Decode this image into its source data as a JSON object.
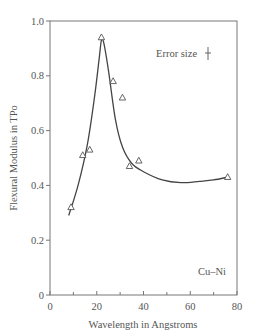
{
  "chart_data": {
    "type": "scatter",
    "title": "",
    "xlabel": "Wavelength in Angstroms",
    "ylabel": "Flexural Modulus in TPo",
    "xlim": [
      0,
      80
    ],
    "ylim": [
      0,
      1.0
    ],
    "x_ticks": [
      "0",
      "20",
      "40",
      "60",
      "80"
    ],
    "y_ticks": [
      "0",
      "0.2",
      "0.4",
      "0.6",
      "0.8",
      "1.0"
    ],
    "grid": false,
    "series": [
      {
        "name": "Cu-Ni data",
        "marker": "triangle-open",
        "x": [
          9,
          14,
          17,
          22,
          27,
          31,
          34,
          38,
          76
        ],
        "y": [
          0.32,
          0.51,
          0.53,
          0.94,
          0.78,
          0.72,
          0.47,
          0.49,
          0.43
        ]
      }
    ],
    "fit_curve": {
      "name": "fitted curve",
      "x": [
        8,
        12,
        16,
        19,
        21,
        22,
        23,
        25,
        28,
        31,
        35,
        40,
        48,
        56,
        64,
        70,
        76
      ],
      "y": [
        0.29,
        0.4,
        0.55,
        0.72,
        0.86,
        0.93,
        0.92,
        0.82,
        0.64,
        0.54,
        0.48,
        0.45,
        0.42,
        0.41,
        0.415,
        0.42,
        0.43
      ]
    },
    "annotations": [
      "Error size",
      "Cu–Ni"
    ]
  }
}
